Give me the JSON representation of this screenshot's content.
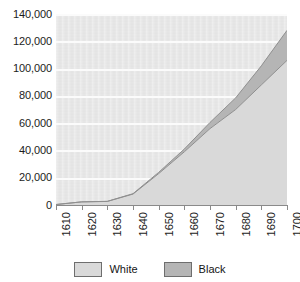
{
  "chart_data": {
    "type": "area",
    "stacked": true,
    "title": "",
    "subtitle": "",
    "xlabel": "",
    "ylabel": "",
    "categories": [
      "1610",
      "1620",
      "1630",
      "1640",
      "1650",
      "1660",
      "1670",
      "1680",
      "1690",
      "1700"
    ],
    "x": [
      1610,
      1620,
      1630,
      1640,
      1650,
      1660,
      1670,
      1680,
      1690,
      1700
    ],
    "series": [
      {
        "name": "White",
        "color": "#d9d9d9",
        "values": [
          350,
          2300,
          2600,
          8000,
          23000,
          39000,
          56000,
          70000,
          88000,
          106000
        ]
      },
      {
        "name": "Black",
        "color": "#b5b5b5",
        "values": [
          0,
          0,
          100,
          300,
          900,
          2000,
          4500,
          8500,
          14000,
          22000
        ]
      }
    ],
    "totals": [
      350,
      2300,
      2700,
      8300,
      23900,
      41000,
      60500,
      78500,
      102000,
      128000
    ],
    "xlim": [
      1610,
      1700
    ],
    "ylim": [
      0,
      140000
    ],
    "ytick_values": [
      0,
      20000,
      40000,
      60000,
      80000,
      100000,
      120000,
      140000
    ],
    "ytick_labels": [
      "0",
      "20,000",
      "40,000",
      "60,000",
      "80,000",
      "100,000",
      "120,000",
      "140,000"
    ],
    "xtick_labels": [
      "1610",
      "1620",
      "1630",
      "1640",
      "1650",
      "1660",
      "1670",
      "1680",
      "1690",
      "1700"
    ],
    "grid": true,
    "grid_axis": "y",
    "grid_color": "#fbfbfb",
    "plot_background": "#e9e9e9",
    "legend_position": "bottom",
    "legend": [
      {
        "label": "White",
        "color": "#d9d9d9"
      },
      {
        "label": "Black",
        "color": "#b5b5b5"
      }
    ]
  }
}
